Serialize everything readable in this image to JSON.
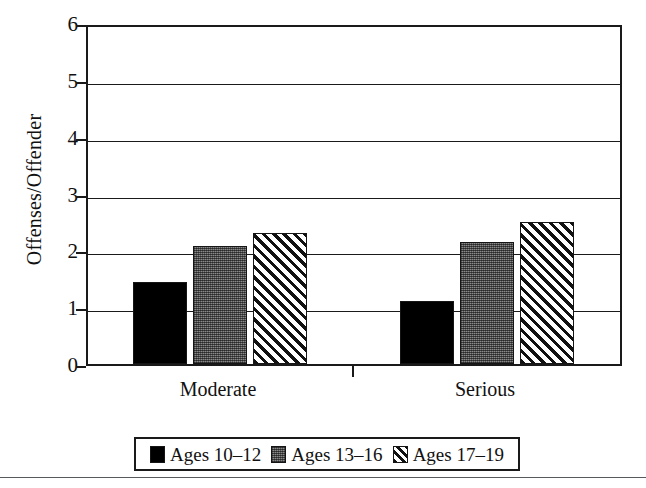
{
  "chart_data": {
    "type": "bar",
    "title": "",
    "subtitle": "",
    "xlabel": "",
    "ylabel": "Offenses/Offender",
    "categories": [
      "Moderate",
      "Serious"
    ],
    "series": [
      {
        "name": "Ages 10–12",
        "values": [
          1.45,
          1.1
        ],
        "fill": "solid",
        "color": "#000000"
      },
      {
        "name": "Ages 13–16",
        "values": [
          2.07,
          2.15
        ],
        "fill": "stipple",
        "color": "#8a8a8a"
      },
      {
        "name": "Ages 17–19",
        "values": [
          2.3,
          2.5
        ],
        "fill": "hatch",
        "color": "#ffffff"
      }
    ],
    "ylim": [
      0,
      6
    ],
    "yticks": [
      0,
      1,
      2,
      3,
      4,
      5,
      6
    ],
    "ytick_labels": [
      "0",
      "1",
      "2",
      "3",
      "4",
      "5",
      "6"
    ],
    "grid": true,
    "grid_axis": "y",
    "legend_position": "bottom",
    "frame": true,
    "axis_color": "#1a1a1a",
    "background": "#ffffff"
  },
  "legend": {
    "items": [
      {
        "label": "Ages 10–12",
        "fill": "solid"
      },
      {
        "label": "Ages 13–16",
        "fill": "stipple"
      },
      {
        "label": "Ages 17–19",
        "fill": "hatch"
      }
    ]
  }
}
